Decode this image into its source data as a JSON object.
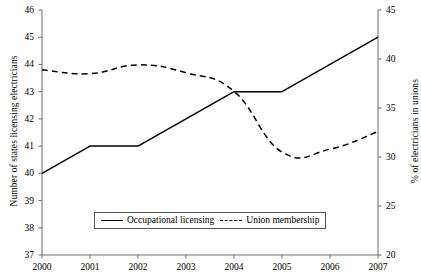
{
  "chart_data": {
    "type": "line",
    "title": "",
    "subtitle": "",
    "xlabel": "",
    "categories": [
      "2000",
      "2001",
      "2002",
      "2003",
      "2004",
      "2005",
      "2006",
      "2007"
    ],
    "x": [
      2000,
      2001,
      2002,
      2003,
      2004,
      2005,
      2006,
      2007
    ],
    "xlim": [
      2000,
      2007
    ],
    "grid": false,
    "legend_position": "bottom-center",
    "axes": {
      "left": {
        "label": "Number of states licensing electricians",
        "ylim": [
          37,
          46
        ],
        "ticks": [
          37,
          38,
          39,
          40,
          41,
          42,
          43,
          44,
          45,
          46
        ],
        "tick_labels": [
          "37",
          "38",
          "39",
          "40",
          "41",
          "42",
          "43",
          "44",
          "45",
          "46"
        ]
      },
      "right": {
        "label": "% of electricians in unions",
        "ylim": [
          20,
          45
        ],
        "ticks": [
          20,
          25,
          30,
          35,
          40,
          45
        ],
        "tick_labels": [
          "20",
          "25",
          "30",
          "35",
          "40",
          "45"
        ]
      }
    },
    "series": [
      {
        "name": "Occupational licensing",
        "axis": "left",
        "style": "solid",
        "color": "#000000",
        "values": [
          40,
          41,
          41,
          42,
          43,
          43,
          44,
          45
        ]
      },
      {
        "name": "Union membership",
        "axis": "right",
        "style": "dashed",
        "color": "#000000",
        "values": [
          38.9,
          38.5,
          39.4,
          38.6,
          36.7,
          30.5,
          30.8,
          32.6
        ]
      }
    ]
  },
  "legend": {
    "items": [
      {
        "label": "Occupational licensing",
        "style": "solid"
      },
      {
        "label": "Union membership",
        "style": "dashed"
      }
    ]
  },
  "left_axis": {
    "title": "Number of states licensing electricians",
    "tick_labels": [
      "46",
      "45",
      "44",
      "43",
      "42",
      "41",
      "40",
      "39",
      "38",
      "37"
    ]
  },
  "right_axis": {
    "title": "% of electricians in unions",
    "tick_labels": [
      "45",
      "40",
      "35",
      "30",
      "25",
      "20"
    ]
  },
  "x_axis": {
    "tick_labels": [
      "2000",
      "2001",
      "2002",
      "2003",
      "2004",
      "2005",
      "2006",
      "2007"
    ]
  }
}
